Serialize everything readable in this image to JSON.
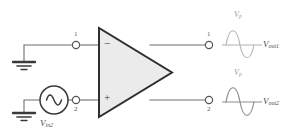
{
  "diagram": {
    "type": "circuit-schematic",
    "colors": {
      "wire": "#6e6e6e",
      "component_outline": "#3a3a3a",
      "opamp_fill": "#ebebeb",
      "text": "#4a4a4a",
      "faint_text": "#9a9a9a",
      "waveform_top": "#b9b9b9",
      "waveform_bottom": "#8e8e8e",
      "background": "#ffffff"
    },
    "source": {
      "label_v": "V",
      "label_sub": "in2",
      "symbol": "ac-sine-source"
    },
    "input_terminals": [
      {
        "number": "1",
        "polarity": "−"
      },
      {
        "number": "2",
        "polarity": "+"
      }
    ],
    "output_terminals": [
      {
        "number": "1"
      },
      {
        "number": "2"
      }
    ],
    "opamp": {
      "minus": "−",
      "plus": "+"
    },
    "grounds": [
      {
        "name": "ground-top"
      },
      {
        "name": "ground-bottom"
      }
    ],
    "waveforms": [
      {
        "name": "out1",
        "peak_label_v": "V",
        "peak_label_sub": "p",
        "signal_label_v": "V",
        "signal_label_sub": "out1",
        "phase": "positive-first"
      },
      {
        "name": "out2",
        "peak_label_v": "V",
        "peak_label_sub": "p",
        "signal_label_v": "V",
        "signal_label_sub": "out2",
        "phase": "positive-first"
      }
    ]
  }
}
